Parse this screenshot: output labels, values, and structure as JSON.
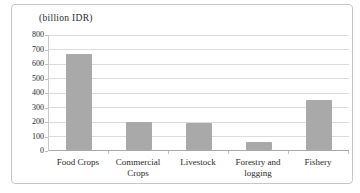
{
  "chart_data": {
    "type": "bar",
    "title": "(billion IDR)",
    "categories": [
      "Food Crops",
      "Commercial Crops",
      "Livestock",
      "Forestry and logging",
      "Fishery"
    ],
    "values": [
      660,
      190,
      183,
      55,
      345
    ],
    "xlabel": "",
    "ylabel": "(billion IDR)",
    "ylim": [
      0,
      800
    ],
    "yticks": [
      0,
      100,
      200,
      300,
      400,
      500,
      600,
      700,
      800
    ],
    "grid": true,
    "legend": "none",
    "bar_color": "#a9a9a9",
    "gridline_color": "#dcdcdc",
    "axis_color": "#a8a8a8",
    "border_color": "#c6c6c6",
    "text_color": "#2a2a2a"
  }
}
